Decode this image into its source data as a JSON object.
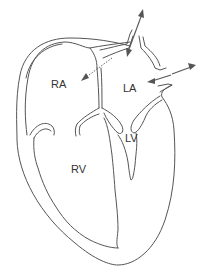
{
  "diagram": {
    "type": "heart-cross-section",
    "labels": {
      "ra": "RA",
      "la": "LA",
      "lv": "LV",
      "rv": "RV"
    },
    "arrows": [
      {
        "name": "pulmonary-vein-upper-bidirectional",
        "style": "solid",
        "direction": "bidirectional"
      },
      {
        "name": "pulmonary-vein-right-bidirectional",
        "style": "solid",
        "direction": "bidirectional"
      },
      {
        "name": "la-to-ra-shunt",
        "style": "dotted",
        "direction": "la-to-ra"
      }
    ],
    "colors": {
      "line": "#555555",
      "background": "#ffffff",
      "text": "#333333"
    }
  }
}
